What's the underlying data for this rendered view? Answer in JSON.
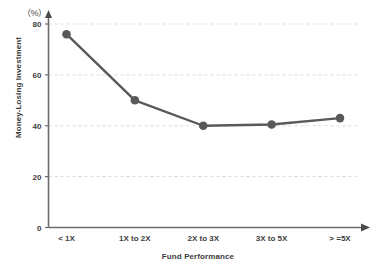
{
  "chart_data": {
    "type": "line",
    "title": "",
    "unit_label": "（%）",
    "xlabel": "Fund Performance",
    "ylabel": "Money-Losing Investment",
    "categories": [
      "< 1X",
      "1X to 2X",
      "2X to 3X",
      "3X to 5X",
      "> =5X"
    ],
    "values": [
      76,
      50,
      40,
      40.5,
      43
    ],
    "series": [
      {
        "name": "Money-Losing Investment",
        "values": [
          76,
          50,
          40,
          40.5,
          43
        ]
      }
    ],
    "ylim": [
      0,
      80
    ],
    "yticks": [
      0,
      20,
      40,
      60,
      80
    ],
    "ytick_labels": [
      "0",
      "20",
      "40",
      "60",
      "80"
    ],
    "grid": true,
    "grid_axis": "y",
    "grid_style": "dashed",
    "legend": "none",
    "colors": {
      "line": "#595959",
      "marker": "#595959",
      "axis": "#6b6b6b",
      "grid": "#e2d7dd",
      "text": "#3d3d3d",
      "background": "#ffffff"
    }
  }
}
